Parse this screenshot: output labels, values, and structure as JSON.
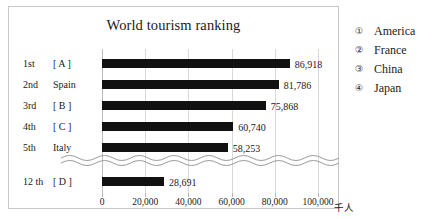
{
  "chart_data": {
    "type": "bar",
    "orientation": "horizontal",
    "title": "World tourism ranking",
    "xlabel": "",
    "ylabel": "",
    "unit_label": "千人",
    "xlim": [
      0,
      100000
    ],
    "grid": true,
    "axis_break": true,
    "axis_break_after_index": 4,
    "xticks": [
      0,
      20000,
      40000,
      60000,
      80000,
      100000
    ],
    "xtick_labels": [
      "0",
      "20,000",
      "40,000",
      "60,000",
      "80,000",
      "100,000"
    ],
    "categories": [
      "[ A ]",
      "Spain",
      "[ B ]",
      "[ C ]",
      "Italy",
      "[ D ]"
    ],
    "ranks": [
      "1st",
      "2nd",
      "3rd",
      "4th",
      "5th",
      "12 th"
    ],
    "values": [
      86918,
      81786,
      75868,
      60740,
      58253,
      28691
    ],
    "value_labels": [
      "86,918",
      "81,786",
      "75,868",
      "60,740",
      "58,253",
      "28,691"
    ],
    "bar_color": "#111111",
    "rows": [
      {
        "rank": "1st",
        "category": "[ A ]",
        "value": 86918,
        "value_label": "86,918"
      },
      {
        "rank": "2nd",
        "category": "Spain",
        "value": 81786,
        "value_label": "81,786"
      },
      {
        "rank": "3rd",
        "category": "[ B ]",
        "value": 75868,
        "value_label": "75,868"
      },
      {
        "rank": "4th",
        "category": "[ C ]",
        "value": 60740,
        "value_label": "60,740"
      },
      {
        "rank": "5th",
        "category": "Italy",
        "value": 58253,
        "value_label": "58,253"
      },
      {
        "rank": "12 th",
        "category": "[ D ]",
        "value": 28691,
        "value_label": "28,691"
      }
    ]
  },
  "legend": {
    "items": [
      {
        "marker": "①",
        "label": "America"
      },
      {
        "marker": "②",
        "label": "France"
      },
      {
        "marker": "③",
        "label": "China"
      },
      {
        "marker": "④",
        "label": "Japan"
      }
    ]
  },
  "colors": {
    "bar": "#111111",
    "grid": "#d9d9d9",
    "frame": "#c8c8c8",
    "text": "#1a1a1a"
  }
}
